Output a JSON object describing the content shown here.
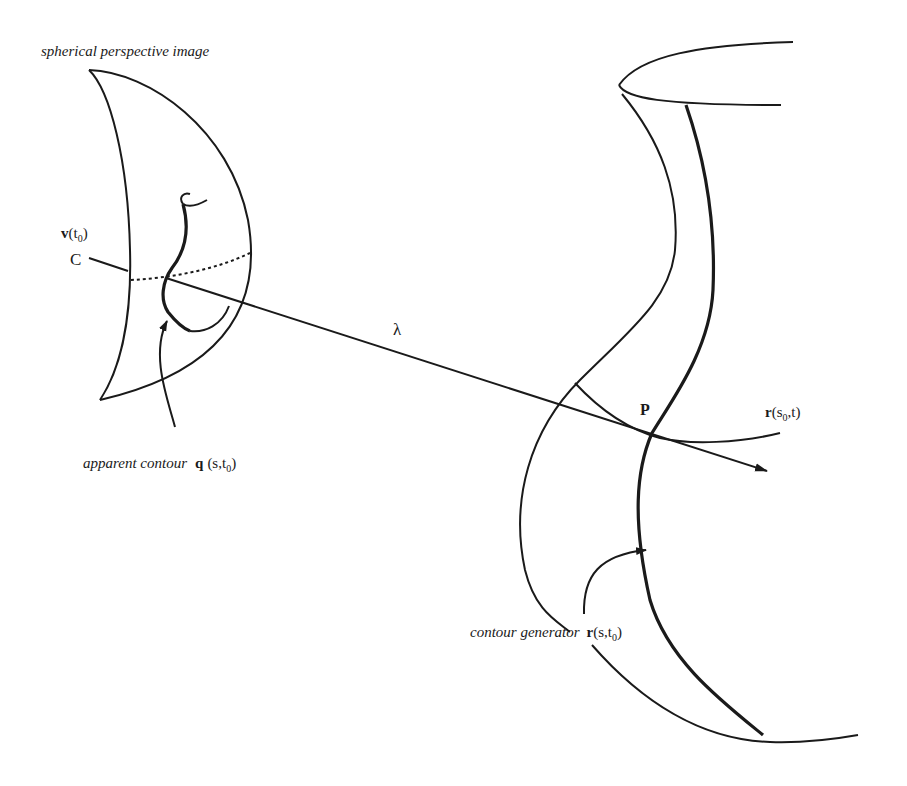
{
  "figure": {
    "stroke_color": "#1a1a1a",
    "background": "#ffffff",
    "labels": {
      "spherical_image": "spherical perspective image",
      "viewpoint_v": "v",
      "viewpoint_arg_open": "(t",
      "viewpoint_sub": "0",
      "viewpoint_arg_close": ")",
      "center": "C",
      "lambda": "λ",
      "point": "P",
      "curve_r": "r",
      "curve_r_arg_open": "(s",
      "curve_r_sub": "0",
      "curve_r_arg_close": ",t)",
      "apparent_contour_text": "apparent contour",
      "apparent_contour_q": "q",
      "apparent_contour_arg_open": "(s,t",
      "apparent_contour_sub": "0",
      "apparent_contour_arg_close": ")",
      "contour_generator_text": "contour generator",
      "contour_generator_r": "r",
      "contour_generator_arg_open": "(s,t",
      "contour_generator_sub": "0",
      "contour_generator_arg_close": ")"
    },
    "elements": [
      "spherical-image-crescent",
      "viewing-ray",
      "dotted-great-circle",
      "apparent-contour-curve",
      "surface-outline",
      "contour-generator-curve",
      "s0-parameter-curve",
      "pointer-arrows"
    ]
  }
}
